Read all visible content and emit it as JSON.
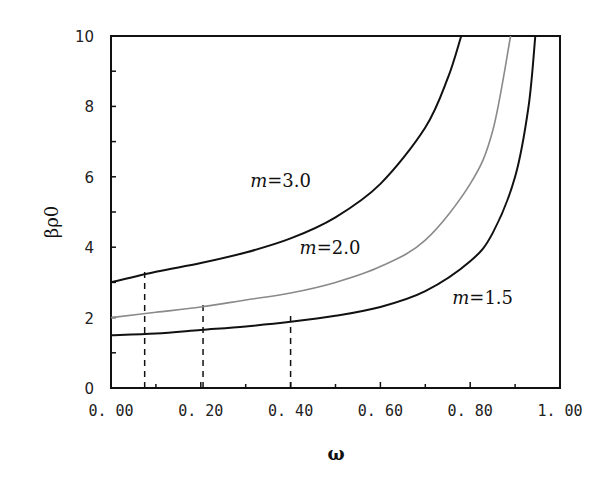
{
  "chart_data": {
    "type": "line",
    "title": "",
    "xlabel": "ω",
    "ylabel": "βρ0",
    "xlim": [
      0.0,
      1.0
    ],
    "ylim": [
      0,
      10
    ],
    "grid": false,
    "legend": "inline curve labels",
    "x_ticks": [
      "0.00",
      "0.20",
      "0.40",
      "0.60",
      "0.80",
      "1.00"
    ],
    "y_ticks": [
      "0",
      "2",
      "4",
      "6",
      "8",
      "10"
    ],
    "series": [
      {
        "name": "m=3.0",
        "label": "m=3.0",
        "color": "#111111",
        "x": [
          0.0,
          0.1,
          0.2,
          0.3,
          0.4,
          0.5,
          0.6,
          0.7,
          0.75,
          0.78
        ],
        "y": [
          3.0,
          3.3,
          3.55,
          3.85,
          4.25,
          4.85,
          5.8,
          7.4,
          8.8,
          10.0
        ]
      },
      {
        "name": "m=2.0",
        "label": "m=2.0",
        "color": "#8a8a8a",
        "x": [
          0.0,
          0.1,
          0.2,
          0.3,
          0.4,
          0.5,
          0.6,
          0.7,
          0.8,
          0.85,
          0.89
        ],
        "y": [
          2.0,
          2.15,
          2.3,
          2.5,
          2.7,
          3.0,
          3.45,
          4.2,
          5.8,
          7.3,
          10.0
        ]
      },
      {
        "name": "m=1.5",
        "label": "m=1.5",
        "color": "#111111",
        "x": [
          0.0,
          0.1,
          0.2,
          0.3,
          0.4,
          0.5,
          0.6,
          0.7,
          0.8,
          0.85,
          0.9,
          0.93,
          0.945
        ],
        "y": [
          1.5,
          1.55,
          1.65,
          1.75,
          1.88,
          2.05,
          2.3,
          2.75,
          3.6,
          4.4,
          6.0,
          8.0,
          10.0
        ]
      }
    ],
    "annotations": {
      "dashed_verticals": [
        {
          "x": 0.075,
          "y_top": 3.3
        },
        {
          "x": 0.205,
          "y_top": 2.4
        },
        {
          "x": 0.4,
          "y_top": 2.1
        }
      ],
      "curve_labels": [
        {
          "text": "m=3.0",
          "x": 0.31,
          "y": 5.7
        },
        {
          "text": "m=2.0",
          "x": 0.42,
          "y": 3.8
        },
        {
          "text": "m=1.5",
          "x": 0.76,
          "y": 2.4
        }
      ]
    }
  }
}
